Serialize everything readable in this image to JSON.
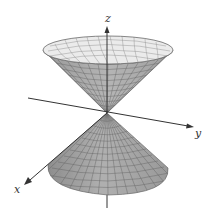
{
  "figure": {
    "surface_color": "#a6a6a6",
    "inner_color": "#e9e9e9",
    "mesh_color": "#555555",
    "axis_color": "#333333",
    "axes": {
      "x": {
        "label": "x"
      },
      "y": {
        "label": "y"
      },
      "z": {
        "label": "z"
      }
    }
  }
}
